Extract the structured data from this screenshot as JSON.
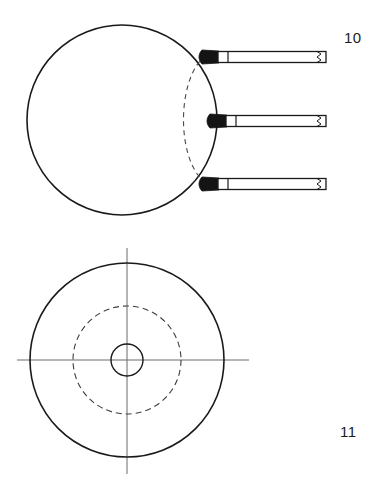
{
  "sheet": {
    "title": "Patent drawing sheet: sphere with radial leads and concentric circle plan view",
    "background_color": "#ffffff",
    "ink_color": "#1a1a1a",
    "width": 382,
    "height": 482
  },
  "figures": [
    {
      "id": "figure-10",
      "label": "10",
      "label_position": {
        "x": 344,
        "y": 30
      },
      "caption": "Side elevation of spherical body with three horizontal leads",
      "body": {
        "name": "sphere-outline",
        "shape": "circle",
        "center": {
          "x": 122,
          "y": 120
        },
        "radius": 95,
        "stroke": "#1a1a1a",
        "stroke_width": 1.6,
        "fill": "none"
      },
      "hidden_arc": {
        "name": "hidden-edge-arc",
        "description": "dashed arc indicating hidden flattened face",
        "start": {
          "x": 206,
          "y": 55
        },
        "end": {
          "x": 206,
          "y": 183
        },
        "bulge_x": 182,
        "dash": "5,4",
        "stroke": "#4a4a4a",
        "stroke_width": 1.1
      },
      "leads": [
        {
          "name": "lead-top",
          "index": 1,
          "tip_x": 204,
          "y_center": 57,
          "right_x": 326,
          "thickness": 11,
          "tip_fill": "#141414",
          "tip_length": 14,
          "collar_x": 222,
          "break_x": 316
        },
        {
          "name": "lead-middle",
          "index": 2,
          "tip_x": 212,
          "y_center": 121,
          "right_x": 326,
          "thickness": 11,
          "tip_fill": "#141414",
          "tip_length": 14,
          "collar_x": 230,
          "break_x": 316
        },
        {
          "name": "lead-bottom",
          "index": 3,
          "tip_x": 204,
          "y_center": 184,
          "right_x": 326,
          "thickness": 11,
          "tip_fill": "#141414",
          "tip_length": 14,
          "collar_x": 222,
          "break_x": 316
        }
      ]
    },
    {
      "id": "figure-11",
      "label": "11",
      "label_position": {
        "x": 340,
        "y": 424
      },
      "caption": "Plan view with concentric outer circle, hidden dashed circle and central bore",
      "center": {
        "x": 127,
        "y": 360
      },
      "circles": [
        {
          "name": "outer-circle",
          "radius": 97,
          "style": "solid",
          "stroke": "#1a1a1a",
          "stroke_width": 1.6,
          "fill": "none"
        },
        {
          "name": "hidden-dashed-circle",
          "radius": 54,
          "style": "dashed",
          "dash": "6,4",
          "stroke": "#3d3d3d",
          "stroke_width": 1.1,
          "fill": "none"
        },
        {
          "name": "inner-bore-circle",
          "radius": 16,
          "style": "solid",
          "stroke": "#1a1a1a",
          "stroke_width": 1.4,
          "fill": "none"
        }
      ],
      "center_lines": [
        {
          "name": "vertical-center-line",
          "orientation": "vertical",
          "x": 127,
          "y1": 248,
          "y2": 474,
          "stroke": "#6b6b6b",
          "stroke_width": 1.0
        },
        {
          "name": "horizontal-center-line",
          "orientation": "horizontal",
          "y": 360,
          "x1": 17,
          "x2": 249,
          "stroke": "#6b6b6b",
          "stroke_width": 1.0
        }
      ]
    }
  ]
}
